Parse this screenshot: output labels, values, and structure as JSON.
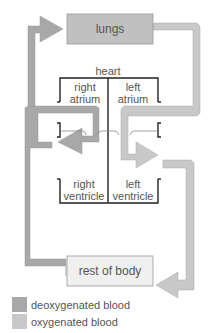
{
  "title": "heart",
  "boxes": {
    "lungs": "lungs",
    "body": "rest of body"
  },
  "chambers": {
    "right_atrium": [
      "right",
      "atrium"
    ],
    "left_atrium": [
      "left",
      "atrium"
    ],
    "right_ventricle": [
      "right",
      "ventricle"
    ],
    "left_ventricle": [
      "left",
      "ventricle"
    ]
  },
  "legend": [
    {
      "label": "deoxygenated blood",
      "color": "#a8a8a8"
    },
    {
      "label": "oxygenated blood",
      "color": "#c8c8c8"
    }
  ],
  "colors": {
    "deoxy": "#a8a8a8",
    "oxy": "#c8c8c8",
    "box_lungs": "#c0c0c0",
    "box_body": "#f0f0f0",
    "outline": "#222222"
  }
}
